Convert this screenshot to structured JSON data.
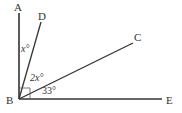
{
  "diagram": {
    "points": {
      "A": {
        "label": "A",
        "x": 19,
        "y": 8
      },
      "B": {
        "label": "B",
        "x": 19,
        "y": 99
      },
      "C": {
        "label": "C",
        "x": 135,
        "y": 41
      },
      "D": {
        "label": "D",
        "x": 41,
        "y": 22
      },
      "E": {
        "label": "E",
        "x": 163,
        "y": 99
      }
    },
    "angle_labels": {
      "ABD": "x°",
      "DBC": "2x°",
      "CBE": "33°"
    },
    "right_angle_marker_at": "B",
    "colors": {
      "line": "#333333",
      "text": "#333333",
      "background": "#ffffff"
    }
  }
}
